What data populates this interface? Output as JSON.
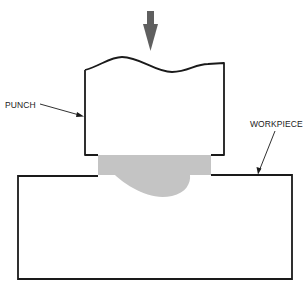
{
  "diagram": {
    "type": "schematic",
    "labels": {
      "punch": "PUNCH",
      "workpiece": "WORKPIECE"
    },
    "colors": {
      "outline": "#1a1a1a",
      "arrow": "#5f5f5f",
      "deformed_zone": "#c4c4c4",
      "background": "#ffffff"
    },
    "components": [
      {
        "id": "force-arrow",
        "description": "downward force arrow above punch"
      },
      {
        "id": "punch",
        "description": "punch body with wavy broken top edge"
      },
      {
        "id": "deformed-zone",
        "description": "shaded displaced material under punch"
      },
      {
        "id": "workpiece",
        "description": "rectangular workpiece block"
      }
    ]
  }
}
